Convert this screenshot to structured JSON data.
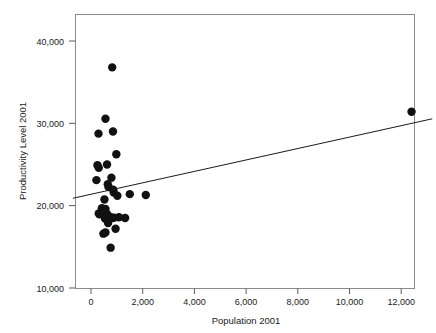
{
  "chart_data": {
    "type": "scatter",
    "title": "",
    "xlabel": "Population 2001",
    "ylabel": "Productivity Level 2001",
    "xlim": [
      -700,
      13200
    ],
    "ylim": [
      10000,
      43300
    ],
    "grid": false,
    "legend": "none",
    "xticks": [
      0,
      2000,
      4000,
      6000,
      8000,
      10000,
      12000
    ],
    "xtick_labels": [
      "0",
      "2,000",
      "4,000",
      "6,000",
      "8,000",
      "10,000",
      "12,000"
    ],
    "yticks": [
      10000,
      20000,
      30000,
      40000
    ],
    "ytick_labels": [
      "10,000",
      "20,000",
      "30,000",
      "40,000"
    ],
    "marker_color": "#111111",
    "marker_size": 4.2,
    "points": [
      {
        "x": 820,
        "y": 36800
      },
      {
        "x": 560,
        "y": 30550
      },
      {
        "x": 290,
        "y": 28750
      },
      {
        "x": 850,
        "y": 29000
      },
      {
        "x": 980,
        "y": 26250
      },
      {
        "x": 250,
        "y": 24900
      },
      {
        "x": 300,
        "y": 24600
      },
      {
        "x": 620,
        "y": 25000
      },
      {
        "x": 210,
        "y": 23100
      },
      {
        "x": 790,
        "y": 23400
      },
      {
        "x": 650,
        "y": 22600
      },
      {
        "x": 680,
        "y": 22250
      },
      {
        "x": 860,
        "y": 21950
      },
      {
        "x": 880,
        "y": 21600
      },
      {
        "x": 520,
        "y": 20750
      },
      {
        "x": 1020,
        "y": 21200
      },
      {
        "x": 1500,
        "y": 21400
      },
      {
        "x": 2120,
        "y": 21300
      },
      {
        "x": 420,
        "y": 19700
      },
      {
        "x": 560,
        "y": 19600
      },
      {
        "x": 300,
        "y": 19050
      },
      {
        "x": 330,
        "y": 18950
      },
      {
        "x": 620,
        "y": 19000
      },
      {
        "x": 540,
        "y": 18450
      },
      {
        "x": 700,
        "y": 18700
      },
      {
        "x": 760,
        "y": 18600
      },
      {
        "x": 830,
        "y": 18500
      },
      {
        "x": 900,
        "y": 18550
      },
      {
        "x": 1080,
        "y": 18600
      },
      {
        "x": 1320,
        "y": 18500
      },
      {
        "x": 660,
        "y": 17900
      },
      {
        "x": 480,
        "y": 16600
      },
      {
        "x": 560,
        "y": 16750
      },
      {
        "x": 950,
        "y": 17200
      },
      {
        "x": 760,
        "y": 14900
      },
      {
        "x": 12400,
        "y": 31400
      }
    ],
    "trend_line": {
      "type": "linear-fit",
      "x_start": -700,
      "y_start": 20900,
      "x_end": 13200,
      "y_end": 30550
    }
  }
}
